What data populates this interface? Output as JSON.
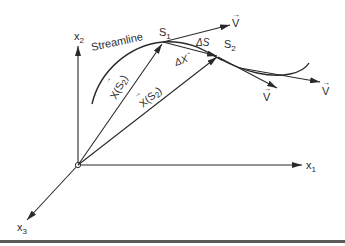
{
  "diagram": {
    "axes": {
      "x1": {
        "label": "x",
        "sub": "1"
      },
      "x2": {
        "label": "x",
        "sub": "2"
      },
      "x3": {
        "label": "x",
        "sub": "3"
      }
    },
    "streamline_label": "Streamline",
    "points": {
      "s1": {
        "label": "S",
        "sub": "1"
      },
      "s2": {
        "label": "S",
        "sub": "2"
      }
    },
    "position_vectors": {
      "upper": {
        "label": "X(S",
        "sub": "2",
        "close": ")"
      },
      "lower": {
        "label": "X(S",
        "sub": "2",
        "close": ")"
      }
    },
    "delta_s": "ΔS",
    "delta_x": "ΔX",
    "velocity_labels": [
      "V",
      "V",
      "V"
    ],
    "colors": {
      "stroke": "#2a2a2a",
      "rule": "#5a5a5a",
      "background": "#ffffff"
    }
  }
}
